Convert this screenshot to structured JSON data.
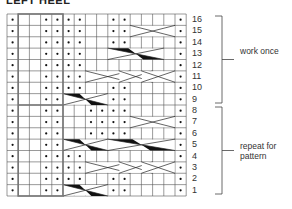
{
  "title": "LEFT HEEL",
  "grid": {
    "cols": 16,
    "rows": 16,
    "x0": 7,
    "y0": 14,
    "cell_w": 11.2,
    "cell_h": 11.375,
    "highlight_box": {
      "col_start": 2,
      "col_end": 5
    },
    "row_data": [
      {
        "row": 16,
        "dots": [
          1,
          4,
          5,
          6,
          7,
          10,
          11,
          16
        ],
        "cables": []
      },
      {
        "row": 15,
        "dots": [
          1,
          4,
          5,
          6,
          7,
          10,
          11,
          16
        ],
        "cables": [
          {
            "from": 12,
            "to": 15,
            "type": "x"
          }
        ]
      },
      {
        "row": 14,
        "dots": [
          1,
          4,
          5,
          6,
          7,
          10,
          11,
          16
        ],
        "cables": []
      },
      {
        "row": 13,
        "dots": [
          1,
          4,
          5,
          6,
          7,
          16
        ],
        "cables": [
          {
            "from": 10,
            "to": 14,
            "type": "twist"
          }
        ]
      },
      {
        "row": 12,
        "dots": [
          1,
          4,
          5,
          6,
          7,
          16
        ],
        "cables": []
      },
      {
        "row": 11,
        "dots": [
          1,
          4,
          5,
          6,
          7,
          16
        ],
        "cables": [
          {
            "from": 8,
            "to": 11,
            "type": "x"
          },
          {
            "from": 11,
            "to": 13,
            "type": "x"
          },
          {
            "from": 13,
            "to": 15,
            "type": "x"
          }
        ]
      },
      {
        "row": 10,
        "dots": [
          1,
          4,
          5,
          6,
          7,
          10,
          11,
          16
        ],
        "cables": []
      },
      {
        "row": 9,
        "dots": [
          1,
          4,
          5,
          10,
          11,
          16
        ],
        "cables": [
          {
            "from": 6,
            "to": 9,
            "type": "twist"
          }
        ]
      },
      {
        "row": 8,
        "dots": [
          1,
          4,
          5,
          8,
          9,
          10,
          11,
          16
        ],
        "cables": []
      },
      {
        "row": 7,
        "dots": [
          1,
          4,
          5,
          8,
          9,
          10,
          11,
          16
        ],
        "cables": [
          {
            "from": 12,
            "to": 15,
            "type": "x"
          }
        ]
      },
      {
        "row": 6,
        "dots": [
          1,
          4,
          5,
          8,
          9,
          10,
          11,
          16
        ],
        "cables": []
      },
      {
        "row": 5,
        "dots": [
          1,
          4,
          5,
          16
        ],
        "cables": [
          {
            "from": 6,
            "to": 9,
            "type": "twist"
          },
          {
            "from": 10,
            "to": 15,
            "type": "twist"
          }
        ]
      },
      {
        "row": 4,
        "dots": [
          1,
          4,
          5,
          6,
          7,
          16
        ],
        "cables": []
      },
      {
        "row": 3,
        "dots": [
          1,
          4,
          5,
          6,
          7,
          16
        ],
        "cables": [
          {
            "from": 8,
            "to": 11,
            "type": "x"
          },
          {
            "from": 11,
            "to": 13,
            "type": "x"
          },
          {
            "from": 13,
            "to": 15,
            "type": "x"
          }
        ]
      },
      {
        "row": 2,
        "dots": [
          1,
          4,
          5,
          6,
          7,
          10,
          11,
          16
        ],
        "cables": []
      },
      {
        "row": 1,
        "dots": [
          1,
          4,
          5,
          10,
          11,
          16
        ],
        "cables": [
          {
            "from": 6,
            "to": 9,
            "type": "twist"
          }
        ]
      }
    ]
  },
  "row_numbers": [
    "16",
    "15",
    "14",
    "13",
    "12",
    "11",
    "10",
    "9",
    "8",
    "7",
    "6",
    "5",
    "4",
    "3",
    "2",
    "1"
  ],
  "brackets": [
    {
      "label": "work once",
      "from_row": 16,
      "to_row": 9
    },
    {
      "label": "repeat for pattern",
      "from_row": 8,
      "to_row": 1
    }
  ],
  "colors": {
    "grid": "#555555",
    "thick": "#777777",
    "ink": "#111111"
  }
}
